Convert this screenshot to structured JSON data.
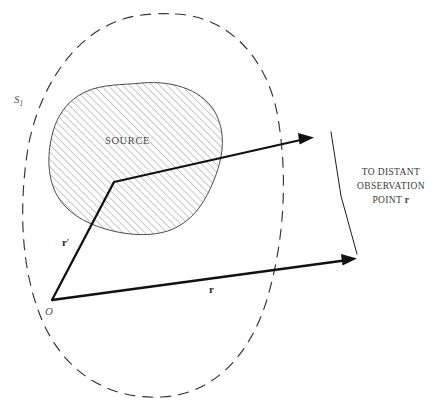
{
  "figure": {
    "type": "physics-vector-diagram",
    "background_color": "#ffffff",
    "labels": {
      "surface": "S",
      "surface_subscript": "1",
      "source": "SOURCE",
      "origin": "O",
      "source_vector": "r",
      "source_vector_prime": "′",
      "field_vector": "r",
      "observation_line_1": "TO DISTANT",
      "observation_line_2": "OBSERVATION",
      "observation_line_3_prefix": "POINT ",
      "observation_line_3_vector": "r"
    },
    "colors": {
      "line": "#111111",
      "dashed_surface": "#333333",
      "hatch": "#777777",
      "blob_outline": "#444444",
      "text": "#3a3a3a"
    },
    "geometry": {
      "origin_point": [
        52,
        300
      ],
      "source_point": [
        114,
        182
      ],
      "upper_arrow_tip": [
        312,
        138
      ],
      "lower_arrow_tip": [
        355,
        258
      ],
      "bracket_top": [
        331,
        132
      ],
      "bracket_bottom": [
        357,
        254
      ]
    }
  }
}
